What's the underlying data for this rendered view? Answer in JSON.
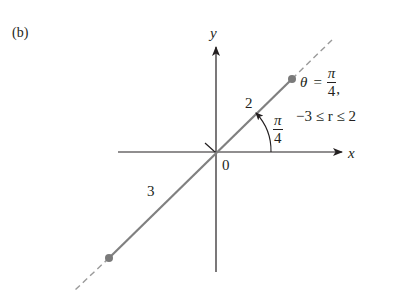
{
  "figure": {
    "panel_label": "(b)",
    "axes": {
      "x_label": "x",
      "y_label": "y",
      "origin_label": "0"
    },
    "ray": {
      "angle_label": {
        "numerator": "π",
        "denominator": "4"
      },
      "segment_positive_label": "2",
      "segment_negative_label": "3"
    },
    "equation": {
      "line1_lhs": "θ",
      "line1_eq": "=",
      "line1_frac_num": "π",
      "line1_frac_den": "4",
      "line1_tail": ",",
      "line2": "−3 ≤ r ≤ 2"
    },
    "colors": {
      "axis": "#231f20",
      "ray": "#808080",
      "endpoint": "#7a7a7a",
      "dashed": "#9a9a9a"
    }
  }
}
